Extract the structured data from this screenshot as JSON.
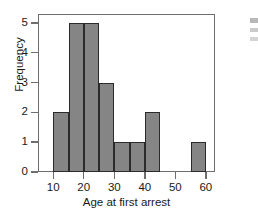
{
  "figure": {
    "background_color": "#ffffff"
  },
  "chart_data": {
    "type": "bar",
    "subtype": "histogram",
    "title": "",
    "xlabel": "Age at first arrest",
    "ylabel": "Frequency",
    "xlim": [
      5,
      63
    ],
    "ylim": [
      0,
      5.3
    ],
    "grid": false,
    "legend": null,
    "bin_width": 5,
    "bar_color": "#858585",
    "bar_edge_color": "#2b2b2b",
    "axis_color": "#6e6e6e",
    "categories": [
      "10-15",
      "15-20",
      "20-25",
      "25-30",
      "30-35",
      "35-40",
      "40-45",
      "45-50",
      "50-55",
      "55-60"
    ],
    "bin_edges": [
      10,
      15,
      20,
      25,
      30,
      35,
      40,
      45,
      50,
      55,
      60
    ],
    "values": [
      2,
      5,
      5,
      3,
      1,
      1,
      2,
      0,
      0,
      1
    ],
    "bars": [
      {
        "label": "10-15",
        "start": 10,
        "end": 15,
        "value": 2
      },
      {
        "label": "15-20",
        "start": 15,
        "end": 20,
        "value": 5
      },
      {
        "label": "20-25",
        "start": 20,
        "end": 25,
        "value": 5
      },
      {
        "label": "25-30",
        "start": 25,
        "end": 30,
        "value": 3
      },
      {
        "label": "30-35",
        "start": 30,
        "end": 35,
        "value": 1
      },
      {
        "label": "35-40",
        "start": 35,
        "end": 40,
        "value": 1
      },
      {
        "label": "40-45",
        "start": 40,
        "end": 45,
        "value": 2
      },
      {
        "label": "45-50",
        "start": 45,
        "end": 50,
        "value": 0
      },
      {
        "label": "50-55",
        "start": 50,
        "end": 55,
        "value": 0
      },
      {
        "label": "55-60",
        "start": 55,
        "end": 60,
        "value": 1
      }
    ],
    "x_ticks": [
      10,
      20,
      30,
      40,
      50,
      60
    ],
    "x_tick_labels": [
      "10",
      "20",
      "30",
      "40",
      "50",
      "60"
    ],
    "y_ticks": [
      0,
      1,
      2,
      3,
      4,
      5
    ],
    "y_tick_labels": [
      "0",
      "1",
      "2",
      "3",
      "4",
      "5"
    ]
  }
}
